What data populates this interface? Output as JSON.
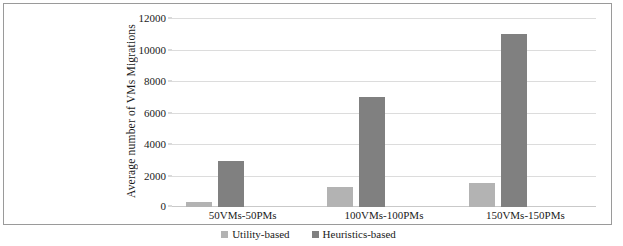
{
  "chart_data": {
    "type": "bar",
    "title": "",
    "xlabel": "",
    "ylabel": "Average number of VMs Migrations",
    "categories": [
      "50VMs-50PMs",
      "100VMs-100PMs",
      "150VMs-150PMs"
    ],
    "series": [
      {
        "name": "Utility-based",
        "values": [
          300,
          1300,
          1500
        ],
        "color": "#b3b3b3"
      },
      {
        "name": "Heuristics-based",
        "values": [
          2900,
          7000,
          11000
        ],
        "color": "#808080"
      }
    ],
    "ylim": [
      0,
      12000
    ],
    "yticks": [
      0,
      2000,
      4000,
      6000,
      8000,
      10000,
      12000
    ],
    "ytick_labels": [
      "0",
      "2000",
      "4000",
      "6000",
      "8000",
      "10000",
      "12000"
    ],
    "grid": true,
    "legend_position": "bottom"
  },
  "figure": {
    "border_color": "#9a9a9a",
    "background": "#ffffff",
    "gridline_color": "#dcdcdc",
    "text_color": "#1a1a1a"
  },
  "caption": {
    "text": ""
  }
}
